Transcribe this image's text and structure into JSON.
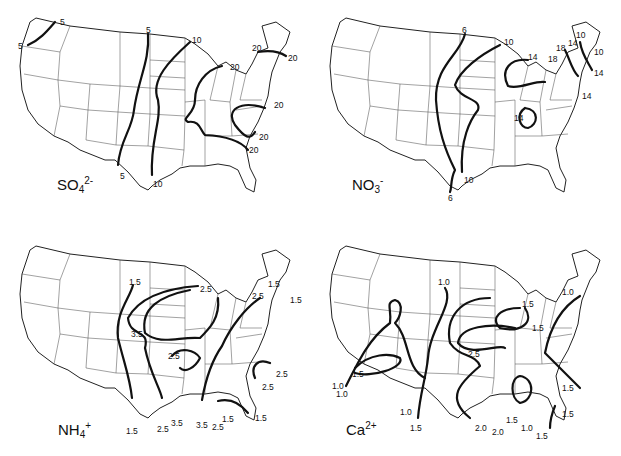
{
  "figure": {
    "panels": [
      {
        "id": "so4",
        "ion_base": "SO",
        "ion_sub": "4",
        "ion_sup": "2-",
        "isopleth_labels": [
          "5",
          "5",
          "5",
          "5",
          "10",
          "10",
          "20",
          "20",
          "20",
          "20",
          "20",
          "20"
        ]
      },
      {
        "id": "no3",
        "ion_base": "NO",
        "ion_sub": "3",
        "ion_sup": "-",
        "isopleth_labels": [
          "6",
          "6",
          "10",
          "10",
          "14",
          "14",
          "14",
          "14",
          "18",
          "18",
          "14",
          "10",
          "10"
        ]
      },
      {
        "id": "nh4",
        "ion_base": "NH",
        "ion_sub": "4",
        "ion_sup": "+",
        "isopleth_labels": [
          "1.5",
          "2.5",
          "3.5",
          "2.5",
          "1.5",
          "2.5",
          "1.5",
          "2.5",
          "2.5",
          "1.5",
          "2.5",
          "3.5",
          "3.5",
          "2.5",
          "1.5",
          "1.5"
        ]
      },
      {
        "id": "ca",
        "ion_base": "Ca",
        "ion_sub": "",
        "ion_sup": "2+",
        "isopleth_labels": [
          "1.0",
          "1.5",
          "1.5",
          "1.0",
          "2.5",
          "1.5",
          "1.0",
          "1.0",
          "1.5",
          "1.0",
          "1.5",
          "2.0",
          "2.0",
          "1.5",
          "1.0",
          "1.5",
          "1.5"
        ]
      }
    ]
  }
}
